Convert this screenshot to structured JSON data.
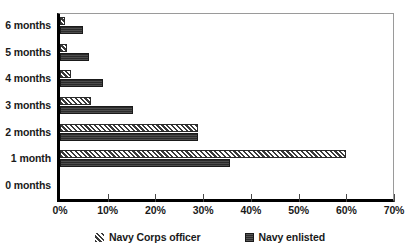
{
  "chart_data": {
    "type": "bar",
    "orientation": "horizontal",
    "title": "",
    "xlabel": "",
    "ylabel": "",
    "categories": [
      "0 months",
      "1 month",
      "2 months",
      "3 months",
      "4 months",
      "5 months",
      "6 months"
    ],
    "series": [
      {
        "name": "Navy Corps officer",
        "pattern": "diagonal-hatch",
        "color": "#3a3a3a",
        "values": [
          0,
          60,
          29,
          6.5,
          2.3,
          1.5,
          1
        ]
      },
      {
        "name": "Navy enlisted",
        "pattern": "solid-dark",
        "color": "#2b2b2b",
        "values": [
          0,
          35.6,
          29,
          15.4,
          9,
          6,
          4.8
        ]
      }
    ],
    "xlim": [
      0,
      70
    ],
    "xticks": [
      0,
      10,
      20,
      30,
      40,
      50,
      60,
      70
    ],
    "xtick_labels": [
      "0%",
      "10%",
      "20%",
      "30%",
      "40%",
      "50%",
      "60%",
      "70%"
    ],
    "grid": false,
    "legend_position": "bottom"
  },
  "legend": {
    "items": [
      {
        "label": "Navy Corps officer",
        "swatch": "officer"
      },
      {
        "label": "Navy enlisted",
        "swatch": "enlisted"
      }
    ]
  }
}
